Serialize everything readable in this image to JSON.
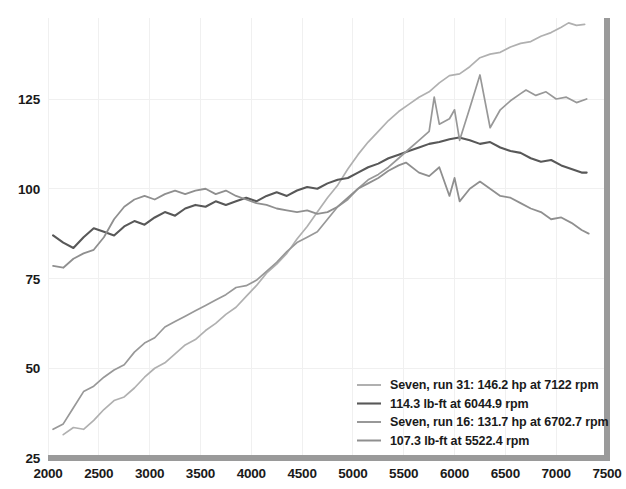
{
  "chart_data": {
    "type": "line",
    "title": "",
    "xlabel": "",
    "ylabel": "",
    "xlim": [
      2000,
      7500
    ],
    "ylim": [
      25,
      150
    ],
    "grid": true,
    "legend_position": "bottom-right",
    "x_ticks": [
      "2000",
      "2500",
      "3000",
      "3500",
      "4000",
      "4500",
      "5000",
      "5500",
      "6000",
      "6500",
      "7000",
      "7500"
    ],
    "y_ticks": [
      "25",
      "50",
      "75",
      "100",
      "125"
    ],
    "series": [
      {
        "name": "Seven, run 31: 146.2 hp at 7122 rpm",
        "color": "#b0b0b0",
        "width": 1.7,
        "peak_value": 146.2,
        "peak_rpm": 7122,
        "x": [
          2150,
          2250,
          2350,
          2450,
          2550,
          2650,
          2750,
          2850,
          2950,
          3050,
          3150,
          3250,
          3350,
          3450,
          3550,
          3650,
          3750,
          3850,
          3950,
          4050,
          4150,
          4250,
          4350,
          4450,
          4550,
          4650,
          4750,
          4850,
          4950,
          5050,
          5150,
          5250,
          5350,
          5450,
          5550,
          5650,
          5750,
          5850,
          5950,
          6050,
          6150,
          6250,
          6350,
          6450,
          6550,
          6650,
          6750,
          6850,
          6950,
          7050,
          7122,
          7200,
          7280
        ],
        "y": [
          31.5,
          33.5,
          33.0,
          35.5,
          38.5,
          41.0,
          42.0,
          44.5,
          47.5,
          50.0,
          51.5,
          54.0,
          56.5,
          58.0,
          60.5,
          62.5,
          65.0,
          67.0,
          70.0,
          73.0,
          76.5,
          79.0,
          82.0,
          86.0,
          89.5,
          93.5,
          97.5,
          101.0,
          105.5,
          109.5,
          113.0,
          116.0,
          119.0,
          121.5,
          123.5,
          125.5,
          127.0,
          129.5,
          131.5,
          132.0,
          134.0,
          136.5,
          137.5,
          138.0,
          139.5,
          140.5,
          141.0,
          142.5,
          143.5,
          145.0,
          146.2,
          145.5,
          145.8
        ]
      },
      {
        "name": "114.3 lb-ft at 6044.9 rpm",
        "color": "#585858",
        "width": 2.1,
        "peak_value": 114.3,
        "peak_rpm": 6044.9,
        "x": [
          2050,
          2150,
          2250,
          2350,
          2450,
          2550,
          2650,
          2750,
          2850,
          2950,
          3050,
          3150,
          3250,
          3350,
          3450,
          3550,
          3650,
          3750,
          3850,
          3950,
          4050,
          4150,
          4250,
          4350,
          4450,
          4550,
          4650,
          4750,
          4850,
          4950,
          5050,
          5150,
          5250,
          5350,
          5450,
          5550,
          5650,
          5750,
          5850,
          5950,
          6045,
          6150,
          6250,
          6350,
          6450,
          6550,
          6650,
          6750,
          6850,
          6950,
          7050,
          7150,
          7250,
          7300
        ],
        "y": [
          87.0,
          85.0,
          83.5,
          86.5,
          89.0,
          88.0,
          87.0,
          89.5,
          91.0,
          90.0,
          92.0,
          93.5,
          92.5,
          94.5,
          95.5,
          95.0,
          96.5,
          95.5,
          96.5,
          97.5,
          96.5,
          98.0,
          99.0,
          98.0,
          99.5,
          100.5,
          100.0,
          101.5,
          102.5,
          103.0,
          104.5,
          106.0,
          107.0,
          108.5,
          109.5,
          110.5,
          111.5,
          112.5,
          113.0,
          113.8,
          114.3,
          113.5,
          112.5,
          113.0,
          111.5,
          110.5,
          110.0,
          108.5,
          107.5,
          108.0,
          106.5,
          105.5,
          104.5,
          104.5
        ]
      },
      {
        "name": "Seven, run 16: 131.7 hp at 6702.7 rpm",
        "color": "#989898",
        "width": 1.7,
        "peak_value": 131.7,
        "peak_rpm": 6702.7,
        "x": [
          2050,
          2150,
          2250,
          2350,
          2450,
          2550,
          2650,
          2750,
          2850,
          2950,
          3050,
          3150,
          3250,
          3350,
          3450,
          3550,
          3650,
          3750,
          3850,
          3950,
          4050,
          4150,
          4250,
          4350,
          4450,
          4550,
          4650,
          4750,
          4850,
          4950,
          5050,
          5150,
          5250,
          5350,
          5450,
          5550,
          5650,
          5750,
          5800,
          5850,
          5950,
          6000,
          6050,
          6150,
          6250,
          6350,
          6450,
          6550,
          6650,
          6703,
          6800,
          6900,
          7000,
          7100,
          7200,
          7300
        ],
        "y": [
          33.0,
          34.5,
          39.0,
          43.5,
          45.0,
          47.5,
          49.5,
          51.0,
          54.5,
          57.0,
          58.5,
          61.5,
          63.0,
          64.5,
          66.0,
          67.5,
          69.0,
          70.5,
          72.5,
          73.0,
          74.5,
          77.0,
          79.5,
          82.5,
          85.0,
          86.5,
          88.0,
          91.5,
          95.0,
          97.0,
          100.0,
          102.5,
          104.0,
          106.0,
          108.5,
          111.0,
          113.5,
          116.0,
          125.5,
          118.0,
          119.5,
          122.0,
          113.5,
          122.5,
          131.7,
          117.0,
          122.0,
          124.5,
          126.5,
          127.5,
          126.0,
          127.0,
          125.0,
          125.5,
          124.0,
          125.0
        ]
      },
      {
        "name": "107.3 lb-ft at 5522.4 rpm",
        "color": "#8f8f8f",
        "width": 1.8,
        "peak_value": 107.3,
        "peak_rpm": 5522.4,
        "x": [
          2050,
          2150,
          2250,
          2350,
          2450,
          2550,
          2650,
          2750,
          2850,
          2950,
          3050,
          3150,
          3250,
          3350,
          3450,
          3550,
          3650,
          3750,
          3850,
          3950,
          4050,
          4150,
          4250,
          4350,
          4450,
          4550,
          4650,
          4750,
          4850,
          4950,
          5050,
          5150,
          5250,
          5350,
          5450,
          5522,
          5650,
          5750,
          5850,
          5950,
          6000,
          6050,
          6150,
          6250,
          6350,
          6450,
          6550,
          6650,
          6750,
          6850,
          6950,
          7050,
          7150,
          7250,
          7320
        ],
        "y": [
          78.5,
          78.0,
          80.5,
          82.0,
          83.0,
          86.5,
          91.5,
          95.0,
          97.0,
          98.0,
          97.0,
          98.5,
          99.5,
          98.5,
          99.5,
          100.0,
          98.5,
          99.5,
          98.0,
          97.0,
          96.0,
          95.5,
          94.5,
          94.0,
          93.5,
          94.0,
          93.0,
          93.5,
          95.0,
          97.5,
          100.0,
          101.5,
          103.0,
          105.0,
          106.5,
          107.3,
          104.5,
          103.5,
          106.0,
          98.0,
          103.0,
          96.5,
          100.0,
          102.0,
          100.0,
          98.0,
          97.5,
          96.0,
          94.5,
          93.5,
          91.5,
          92.0,
          90.5,
          88.5,
          87.5
        ]
      }
    ]
  },
  "axes": {
    "axis_color": "#9a9a9a",
    "grid_color": "#f0f0f0"
  }
}
